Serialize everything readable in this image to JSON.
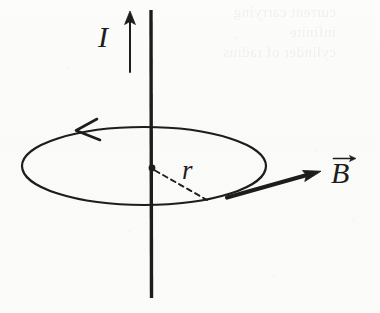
{
  "figure": {
    "kind": "physics-diagram",
    "background_color": "#fbfbfa",
    "ink_color": "#1d1d1d"
  },
  "labels": {
    "current": "I",
    "radius": "r",
    "bfield": "B"
  },
  "icons": {
    "current_arrow": "up-arrow-icon",
    "loop_arrow": "left-arrowhead-icon",
    "bfield_arrow": "right-arrow-icon",
    "vector_accent": "vector-arrow-accent-icon",
    "center_point": "center-dot-icon"
  },
  "geometry": {
    "wire": {
      "x": 151,
      "y_top": 10,
      "y_bottom": 298,
      "stroke_width": 3.4
    },
    "current_arrow": {
      "x": 130,
      "y_tail": 72,
      "y_head": 12,
      "stroke_width": 2.0
    },
    "loop_ellipse": {
      "cx": 144,
      "cy": 166,
      "rx": 122,
      "ry": 39,
      "stroke_width": 2.2
    },
    "loop_arrowhead": {
      "x": 78,
      "y": 130,
      "direction": "left"
    },
    "center_dot": {
      "cx": 152,
      "cy": 168,
      "r": 3.4
    },
    "radius_dashed_line": {
      "x1": 154,
      "y1": 170,
      "x2": 207,
      "y2": 200,
      "dash": "5 4"
    },
    "bfield_arrow": {
      "x1": 228,
      "y1": 197,
      "x2": 320,
      "y2": 172,
      "stroke_width": 4.2
    }
  },
  "ghost_text": {
    "note": "faint ink bleed-through from the reverse side of the scanned page",
    "line1": "current carrying infinite",
    "line2": "cylinder of radius"
  }
}
